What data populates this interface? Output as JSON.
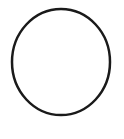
{
  "canvas": {
    "width": 124,
    "height": 139,
    "background_color": "#ffffff",
    "description": "circle-outline-drawing"
  },
  "figure": {
    "name": "circle-outline",
    "shape_type": "ellipse-outline",
    "fill": "none",
    "stroke_color": "#1a1a1a",
    "stroke_width": 2.5,
    "center_x": 61,
    "center_y": 62,
    "radius_x": 49,
    "radius_y": 53,
    "bounds": {
      "left": 12,
      "top": 9,
      "right": 110,
      "bottom": 115,
      "width": 98,
      "height": 106
    }
  }
}
